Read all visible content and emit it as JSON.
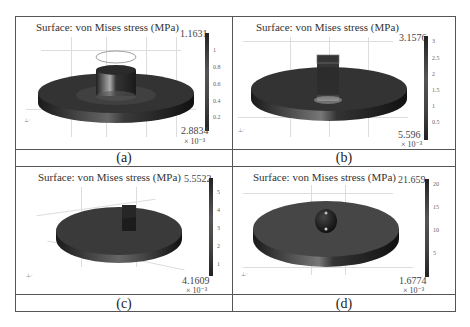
{
  "figure": {
    "panels": [
      {
        "id": "a",
        "caption": "(a)",
        "title": "Surface: von Mises stress (MPa)",
        "colorbar": {
          "max": "1.1631",
          "min": "2.8834",
          "exp": "× 10⁻³",
          "ticks": [
            "1",
            "0.8",
            "0.6",
            "0.4",
            "0.2"
          ]
        }
      },
      {
        "id": "b",
        "caption": "(b)",
        "title": "Surface: von Mises stress (MPa)",
        "colorbar": {
          "max": "3.1576",
          "min": "5.596",
          "exp": "× 10⁻³",
          "ticks": [
            "3",
            "2.5",
            "2",
            "1.5",
            "1",
            "0.5"
          ]
        }
      },
      {
        "id": "c",
        "caption": "(c)",
        "title": "Surface: von Mises stress (MPa)",
        "colorbar": {
          "max": "5.5522",
          "min": "4.1609",
          "exp": "× 10⁻³",
          "ticks": [
            "5",
            "4",
            "3",
            "2",
            "1"
          ]
        }
      },
      {
        "id": "d",
        "caption": "(d)",
        "title": "Surface: von Mises stress (MPa)",
        "colorbar": {
          "max": "21.659",
          "min": "1.6774",
          "exp": "× 10⁻³",
          "ticks": [
            "20",
            "15",
            "10",
            "5"
          ]
        }
      }
    ]
  },
  "colors": {
    "border": "#555555",
    "surface_dark": "#2a2a2a",
    "surface_mid": "#4a4a4a",
    "gridline": "#dddddd"
  }
}
